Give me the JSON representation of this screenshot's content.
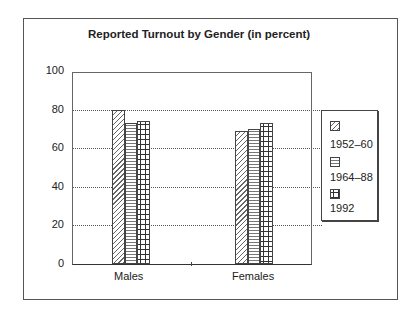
{
  "chart_data": {
    "type": "bar",
    "title": "Reported Turnout by Gender (in percent)",
    "categories": [
      "Males",
      "Females"
    ],
    "series": [
      {
        "name": "1952–60",
        "pattern": "diagonal-hatch",
        "values": [
          80,
          69
        ]
      },
      {
        "name": "1964–88",
        "pattern": "horizontal-lines",
        "values": [
          73,
          70
        ]
      },
      {
        "name": "1992",
        "pattern": "crosses",
        "values": [
          74,
          73
        ]
      }
    ],
    "xlabel": "",
    "ylabel": "",
    "ylim": [
      0,
      100
    ],
    "yticks": [
      "0",
      "20",
      "40",
      "60",
      "80",
      "100"
    ],
    "grid": "horizontal dotted",
    "legend_position": "right"
  }
}
